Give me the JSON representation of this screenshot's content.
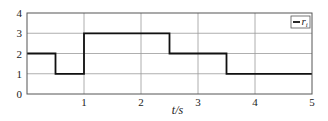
{
  "chart_data": {
    "type": "line",
    "step": true,
    "title": "",
    "xlabel": "t/s",
    "ylabel": "",
    "xlim": [
      0,
      5
    ],
    "ylim": [
      0,
      4
    ],
    "xticks": [
      1,
      2,
      3,
      4,
      5
    ],
    "xtick_labels": [
      "1",
      "2",
      "3",
      "4",
      "5"
    ],
    "yticks": [
      0,
      1,
      2,
      3,
      4
    ],
    "ytick_labels": [
      "0",
      "1",
      "2",
      "3",
      "4"
    ],
    "grid": true,
    "legend": {
      "position": "top-right",
      "entries": [
        "r_i"
      ]
    },
    "series": [
      {
        "name": "r_i",
        "color": "#111111",
        "x": [
          0,
          0.5,
          0.5,
          1,
          1,
          2.5,
          2.5,
          3.5,
          3.5,
          5
        ],
        "y": [
          2,
          2,
          1,
          1,
          3,
          3,
          2,
          2,
          1,
          1
        ]
      }
    ]
  },
  "legend": {
    "label_main": "r",
    "label_sub": "i"
  }
}
